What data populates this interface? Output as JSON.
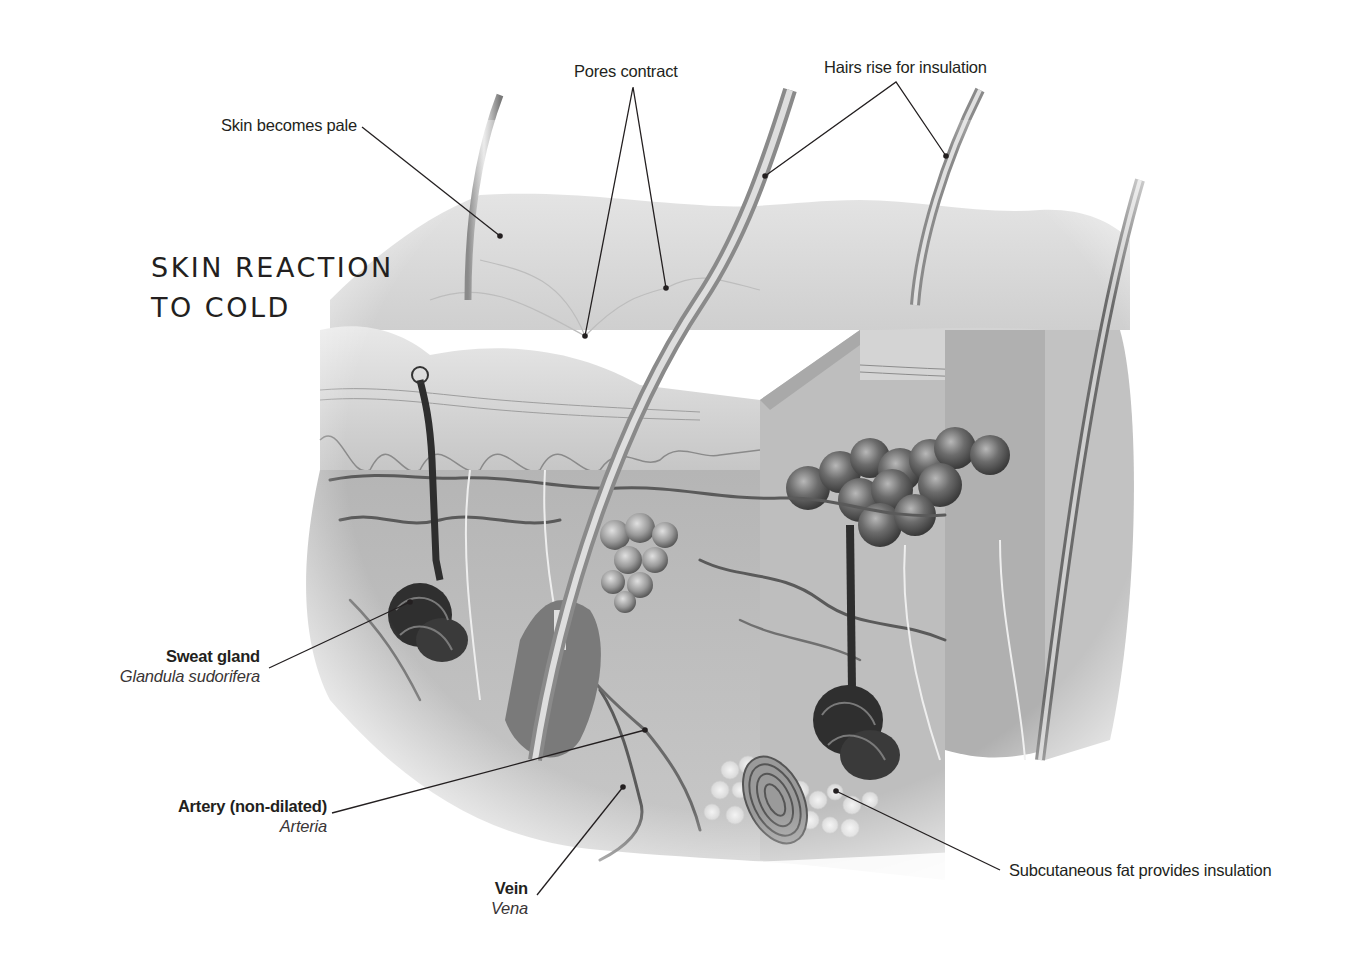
{
  "title": {
    "line1": "SKIN REACTION",
    "line2": "TO COLD"
  },
  "labels": {
    "skin_pale": "Skin becomes pale",
    "pores": "Pores contract",
    "hairs": "Hairs rise for insulation",
    "sweat_gland": {
      "common": "Sweat gland",
      "latin": "Glandula sudorifera"
    },
    "artery": {
      "common": "Artery (non-dilated)",
      "latin": "Arteria"
    },
    "vein": {
      "common": "Vein",
      "latin": "Vena"
    },
    "fat": "Subcutaneous fat provides insulation"
  },
  "colors": {
    "text": "#231f20",
    "leader": "#231f20",
    "skin_light": "#d9d9d9",
    "skin_mid": "#a8a8a8",
    "skin_dark": "#555555"
  },
  "leaders": [
    {
      "id": "skin-pale",
      "points": [
        [
          362,
          127
        ],
        [
          500,
          236
        ]
      ]
    },
    {
      "id": "pores-a",
      "points": [
        [
          633,
          87
        ],
        [
          585,
          336
        ]
      ]
    },
    {
      "id": "pores-b",
      "points": [
        [
          633,
          87
        ],
        [
          666,
          288
        ]
      ]
    },
    {
      "id": "hairs-a",
      "points": [
        [
          896,
          82
        ],
        [
          765,
          176
        ]
      ]
    },
    {
      "id": "hairs-b",
      "points": [
        [
          896,
          82
        ],
        [
          946,
          156
        ]
      ]
    },
    {
      "id": "sweat",
      "points": [
        [
          269,
          668
        ],
        [
          410,
          602
        ]
      ]
    },
    {
      "id": "artery",
      "points": [
        [
          332,
          813
        ],
        [
          645,
          730
        ]
      ]
    },
    {
      "id": "vein",
      "points": [
        [
          537,
          895
        ],
        [
          623,
          787
        ]
      ]
    },
    {
      "id": "fat",
      "points": [
        [
          1000,
          870
        ],
        [
          836,
          791
        ]
      ]
    }
  ]
}
